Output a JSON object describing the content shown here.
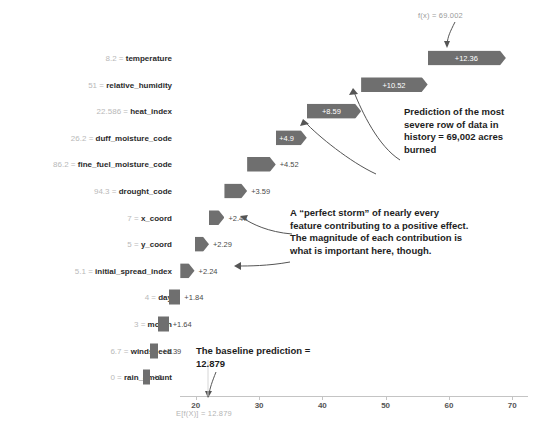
{
  "chart_data": {
    "type": "bar",
    "chart_kind": "shap-waterfall",
    "title": "",
    "xlabel": "",
    "ylabel": "",
    "xlim": [
      17.5,
      72.5
    ],
    "xticks": [
      20,
      30,
      40,
      50,
      60,
      70
    ],
    "grid": false,
    "base_value_label": "E[f(X)] = 12.879",
    "base_value": 12.879,
    "output_value_label": "f(x) = 69.002",
    "output_value": 69.002,
    "categories": [
      "temperature",
      "relative_humidity",
      "heat_index",
      "duff_moisture_code",
      "fine_fuel_moisture_code",
      "drought_code",
      "x_coord",
      "y_coord",
      "initial_spread_index",
      "day",
      "month",
      "windspeed",
      "rain_amount"
    ],
    "values": [
      12.36,
      10.52,
      8.59,
      4.9,
      4.52,
      3.59,
      2.44,
      2.29,
      2.24,
      1.84,
      1.64,
      1.39,
      0
    ],
    "value_labels": [
      "+12.36",
      "+10.52",
      "+8.59",
      "+4.9",
      "+4.52",
      "+3.59",
      "+2.44",
      "+2.29",
      "+2.24",
      "+1.84",
      "+1.64",
      "+1.39",
      "+0"
    ],
    "feature_values": [
      "8.2",
      "51",
      "22.586",
      "26.2",
      "86.2",
      "94.3",
      "7",
      "5",
      "5.1",
      "4",
      "3",
      "6.7",
      "0"
    ],
    "bar_color": "#6f6f6f"
  },
  "rows": [
    {
      "feature_value": "8.2",
      "feature_name": "temperature",
      "value_label": "+12.36",
      "label_inside": true
    },
    {
      "feature_value": "51",
      "feature_name": "relative_humidity",
      "value_label": "+10.52",
      "label_inside": true
    },
    {
      "feature_value": "22.586",
      "feature_name": "heat_index",
      "value_label": "+8.59",
      "label_inside": true
    },
    {
      "feature_value": "26.2",
      "feature_name": "duff_moisture_code",
      "value_label": "+4.9",
      "label_inside": true
    },
    {
      "feature_value": "86.2",
      "feature_name": "fine_fuel_moisture_code",
      "value_label": "+4.52",
      "label_inside": false
    },
    {
      "feature_value": "94.3",
      "feature_name": "drought_code",
      "value_label": "+3.59",
      "label_inside": false
    },
    {
      "feature_value": "7",
      "feature_name": "x_coord",
      "value_label": "+2.44",
      "label_inside": false
    },
    {
      "feature_value": "5",
      "feature_name": "y_coord",
      "value_label": "+2.29",
      "label_inside": false
    },
    {
      "feature_value": "5.1",
      "feature_name": "initial_spread_index",
      "value_label": "+2.24",
      "label_inside": false
    },
    {
      "feature_value": "4",
      "feature_name": "day",
      "value_label": "+1.84",
      "label_inside": false
    },
    {
      "feature_value": "3",
      "feature_name": "month",
      "value_label": "+1.64",
      "label_inside": false
    },
    {
      "feature_value": "6.7",
      "feature_name": "windspeed",
      "value_label": "+1.39",
      "label_inside": false
    },
    {
      "feature_value": "0",
      "feature_name": "rain_amount",
      "value_label": "+0",
      "label_inside": false
    }
  ],
  "axis": {
    "ticks": [
      "20",
      "30",
      "40",
      "50",
      "60",
      "70"
    ]
  },
  "labels": {
    "output": "f(x) = 69.002",
    "baseline": "E[f(X)] = 12.879",
    "separator": "="
  },
  "annotations": {
    "prediction": "Prediction of the most severe row of data in history = 69,002 acres burned",
    "perfect_storm": "A “perfect storm” of nearly every feature contributing to a positive effect. The magnitude of each contribution is what is important here, though.",
    "baseline": "The baseline prediction = 12.879"
  }
}
